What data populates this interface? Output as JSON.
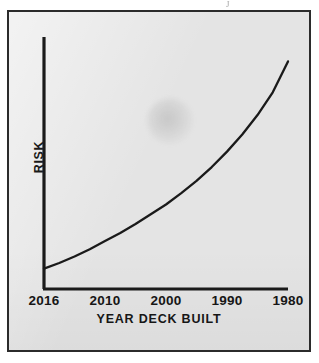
{
  "figure": {
    "background_color": "#e4e4e4",
    "frame_color": "#2b2b2b",
    "line_color": "#1a1a1a",
    "text_color": "#161616",
    "top_artifact_glyph": "J"
  },
  "chart_data": {
    "type": "line",
    "title": "",
    "subtitle": "",
    "xlabel": "YEAR DECK BUILT",
    "ylabel": "RISK",
    "x_tick_labels": [
      "2016",
      "2010",
      "2000",
      "1990",
      "1980"
    ],
    "x_tick_positions": [
      0,
      1,
      2,
      3,
      4
    ],
    "y_tick_labels": [],
    "grid": false,
    "legend": null,
    "annotations": [],
    "axis_style": "open-left-bottom-spines",
    "series": [
      {
        "name": "Risk",
        "x": [
          0,
          0.25,
          0.5,
          0.75,
          1,
          1.25,
          1.5,
          1.75,
          2,
          2.25,
          2.5,
          2.75,
          3,
          3.25,
          3.5,
          3.75,
          4
        ],
        "values": [
          0.125,
          0.16,
          0.2,
          0.245,
          0.295,
          0.345,
          0.4,
          0.46,
          0.52,
          0.59,
          0.665,
          0.75,
          0.845,
          0.95,
          1.07,
          1.21,
          1.4
        ]
      }
    ],
    "xlim": [
      0,
      4
    ],
    "ylim": [
      0,
      1.55
    ]
  }
}
